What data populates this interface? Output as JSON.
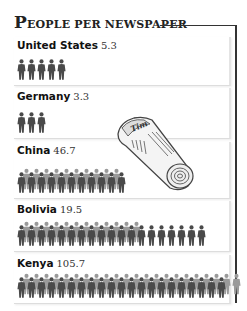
{
  "title": {
    "cap": "P",
    "rest": "EOPLE PER NEWSPAPER",
    "full": "People per newspaper"
  },
  "illustration": {
    "icon": "rolled-newspaper-icon",
    "masthead": "Times"
  },
  "colors": {
    "figure_dark": "#4a4a4a",
    "figure_light": "#9a9a9a",
    "frame": "#333333",
    "panel_border": "#e0e0e0"
  },
  "countries": [
    {
      "name": "United States",
      "value": "5.3",
      "figures": 5
    },
    {
      "name": "Germany",
      "value": "3.3",
      "figures": 3
    },
    {
      "name": "China",
      "value": "46.7",
      "figures": 46.7
    },
    {
      "name": "Bolivia",
      "value": "19.5",
      "figures": 19.5
    },
    {
      "name": "Kenya",
      "value": "105.7",
      "figures": 105.7
    }
  ],
  "chart_data": {
    "type": "bar",
    "title": "People per newspaper",
    "categories": [
      "United States",
      "Germany",
      "China",
      "Bolivia",
      "Kenya"
    ],
    "values": [
      5.3,
      3.3,
      46.7,
      19.5,
      105.7
    ],
    "xlabel": "",
    "ylabel": "People per newspaper",
    "orientation": "horizontal pictogram",
    "legend": "none",
    "grid": false
  }
}
